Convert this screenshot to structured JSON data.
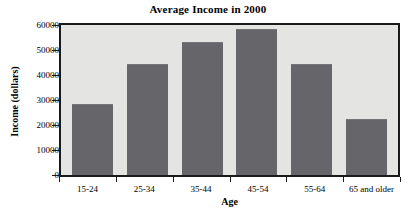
{
  "chart_data": {
    "type": "bar",
    "title": "Average Income in 2000",
    "xlabel": "Age",
    "ylabel": "Income (dollars)",
    "categories": [
      "15-24",
      "25-34",
      "35-44",
      "45-54",
      "55-64",
      "65 and older"
    ],
    "values": [
      28000,
      44000,
      53000,
      58000,
      44000,
      22000
    ],
    "ylim": [
      0,
      60000
    ],
    "ytick_labels": [
      "60000",
      "50000",
      "40000",
      "30000",
      "20000",
      "10000",
      "0"
    ],
    "yticks": [
      60000,
      50000,
      40000,
      30000,
      20000,
      10000,
      0
    ],
    "grid": false,
    "legend": false,
    "bar_color": "#66666a",
    "plot_background": "#e4e4e2",
    "axis_color": "#1a1a1a",
    "page_background": "#ffffff"
  }
}
